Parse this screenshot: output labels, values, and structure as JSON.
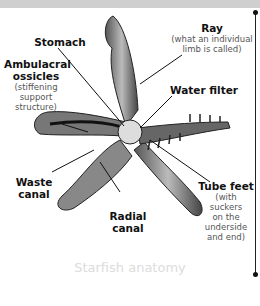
{
  "diagram": {
    "caption": "Starfish anatomy",
    "labels": {
      "ray": {
        "title": "Ray",
        "sub1": "(what an individual",
        "sub2": "limb is called)"
      },
      "stomach": {
        "title": "Stomach"
      },
      "ambulacral": {
        "title1": "Ambulacral",
        "title2": "ossicles",
        "sub1": "(stiffening",
        "sub2": "support",
        "sub3": "structure)"
      },
      "water_filter": {
        "title": "Water filter"
      },
      "tube_feet": {
        "title": "Tube feet",
        "sub1": "(with",
        "sub2": "suckers",
        "sub3": "on the",
        "sub4": "underside",
        "sub5": "and end)"
      },
      "waste_canal": {
        "title1": "Waste",
        "title2": "canal"
      },
      "radial_canal": {
        "title1": "Radial",
        "title2": "canal"
      }
    },
    "colors": {
      "topbar": "#cfcfcf",
      "caption": "#dcdcdc",
      "ink": "#111111"
    }
  }
}
